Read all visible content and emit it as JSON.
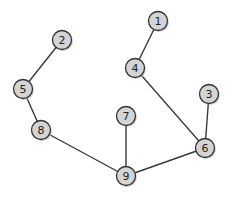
{
  "graph": {
    "nodes": [
      {
        "id": "1",
        "x": 158,
        "y": 21
      },
      {
        "id": "2",
        "x": 62,
        "y": 40
      },
      {
        "id": "3",
        "x": 209,
        "y": 94
      },
      {
        "id": "4",
        "x": 135,
        "y": 68
      },
      {
        "id": "5",
        "x": 23,
        "y": 89
      },
      {
        "id": "6",
        "x": 205,
        "y": 148
      },
      {
        "id": "7",
        "x": 126,
        "y": 116
      },
      {
        "id": "8",
        "x": 41,
        "y": 130
      },
      {
        "id": "9",
        "x": 126,
        "y": 176
      }
    ],
    "edges": [
      [
        "1",
        "4"
      ],
      [
        "2",
        "5"
      ],
      [
        "5",
        "8"
      ],
      [
        "4",
        "6"
      ],
      [
        "3",
        "6"
      ],
      [
        "8",
        "9"
      ],
      [
        "7",
        "9"
      ],
      [
        "9",
        "6"
      ]
    ],
    "node_radius": 9.5,
    "colors": {
      "node_fill": "#d4d4d4",
      "node_stroke": "#333333",
      "edge": "#3a3a3a"
    }
  }
}
